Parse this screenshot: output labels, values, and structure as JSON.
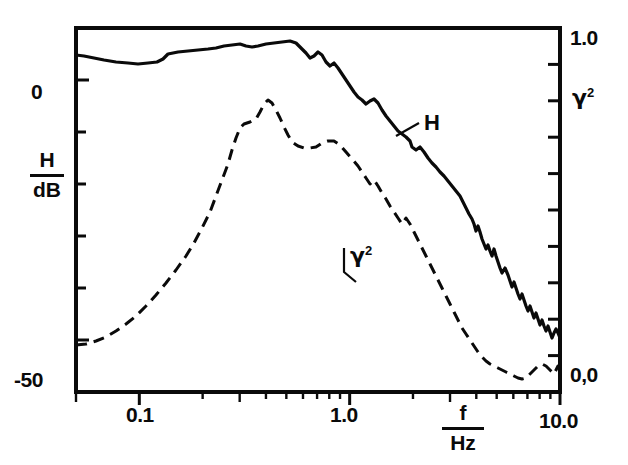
{
  "figure": {
    "background_color": "#ffffff",
    "ink_color": "#0a0a0a",
    "frame": {
      "left": 76,
      "right": 560,
      "top": 28,
      "bottom": 392
    }
  },
  "axes": {
    "left": {
      "label_numerator": "H",
      "label_denominator": "dB",
      "tick_labels": [
        "0",
        "-50"
      ],
      "tick_label_top": "0",
      "tick_label_bottom": "-50",
      "range_db": [
        -60,
        10
      ],
      "tick_step_db": 10
    },
    "right": {
      "label": "γ²",
      "label_base": "γ",
      "label_exponent": "2",
      "tick_label_top": "1.0",
      "tick_label_bottom": "0,0",
      "range": [
        0.0,
        1.0
      ]
    },
    "bottom": {
      "label_numerator": "f",
      "label_denominator": "Hz",
      "tick_labels": [
        "0.1",
        "1.0",
        "10.0"
      ],
      "scale": "log",
      "range_hz": [
        0.05,
        10.0
      ]
    }
  },
  "curve_labels": {
    "transfer_function": "H",
    "coherence_base": "γ",
    "coherence_exponent": "2"
  },
  "chart_data": {
    "type": "line",
    "title": "",
    "xlabel": "f / Hz",
    "ylabel": "H / dB",
    "y2label": "γ²",
    "xscale": "log",
    "xlim": [
      0.05,
      10.0
    ],
    "ylim": [
      -60,
      10
    ],
    "y2lim": [
      0.0,
      1.0
    ],
    "grid": false,
    "legend": "inline-annotations",
    "xticks": [
      0.1,
      1.0,
      10.0
    ],
    "xticklabels": [
      "0.1",
      "1.0",
      "10.0"
    ],
    "yticks": [
      0,
      -50
    ],
    "yticklabels": [
      "0",
      "-50"
    ],
    "y2ticks": [
      0.0,
      1.0
    ],
    "y2ticklabels": [
      "0,0",
      "1.0"
    ],
    "series": [
      {
        "name": "H",
        "axis": "left",
        "style": "solid",
        "linewidth": 3.2,
        "annotation": "H",
        "points_px": [
          [
            76,
            55
          ],
          [
            84,
            56
          ],
          [
            94,
            58
          ],
          [
            104,
            60
          ],
          [
            116,
            62
          ],
          [
            128,
            63
          ],
          [
            138,
            64
          ],
          [
            148,
            63
          ],
          [
            157,
            62
          ],
          [
            163,
            59
          ],
          [
            168,
            54
          ],
          [
            178,
            52
          ],
          [
            188,
            51
          ],
          [
            198,
            50
          ],
          [
            208,
            49
          ],
          [
            216,
            48
          ],
          [
            224,
            46
          ],
          [
            232,
            45
          ],
          [
            240,
            44
          ],
          [
            246,
            46
          ],
          [
            252,
            47
          ],
          [
            258,
            46
          ],
          [
            266,
            44
          ],
          [
            274,
            43
          ],
          [
            282,
            42
          ],
          [
            290,
            41
          ],
          [
            296,
            43
          ],
          [
            300,
            47
          ],
          [
            306,
            53
          ],
          [
            310,
            58
          ],
          [
            314,
            56
          ],
          [
            318,
            52
          ],
          [
            322,
            55
          ],
          [
            326,
            62
          ],
          [
            330,
            66
          ],
          [
            334,
            63
          ],
          [
            338,
            68
          ],
          [
            342,
            74
          ],
          [
            346,
            80
          ],
          [
            350,
            86
          ],
          [
            354,
            92
          ],
          [
            358,
            97
          ],
          [
            362,
            100
          ],
          [
            366,
            104
          ],
          [
            370,
            101
          ],
          [
            374,
            99
          ],
          [
            378,
            103
          ],
          [
            382,
            110
          ],
          [
            386,
            116
          ],
          [
            390,
            121
          ],
          [
            394,
            126
          ],
          [
            398,
            131
          ],
          [
            402,
            134
          ],
          [
            406,
            137
          ],
          [
            410,
            141
          ],
          [
            412,
            147
          ],
          [
            416,
            150
          ],
          [
            420,
            147
          ],
          [
            424,
            152
          ],
          [
            428,
            158
          ],
          [
            432,
            163
          ],
          [
            436,
            167
          ],
          [
            440,
            172
          ],
          [
            444,
            176
          ],
          [
            448,
            181
          ],
          [
            452,
            186
          ],
          [
            456,
            191
          ],
          [
            460,
            196
          ],
          [
            463,
            202
          ],
          [
            466,
            208
          ],
          [
            469,
            214
          ],
          [
            472,
            219
          ],
          [
            474,
            224
          ],
          [
            476,
            231
          ],
          [
            478,
            226
          ],
          [
            480,
            232
          ],
          [
            482,
            239
          ],
          [
            484,
            244
          ],
          [
            486,
            249
          ],
          [
            488,
            245
          ],
          [
            490,
            251
          ],
          [
            492,
            256
          ],
          [
            494,
            249
          ],
          [
            496,
            256
          ],
          [
            498,
            262
          ],
          [
            500,
            268
          ],
          [
            502,
            273
          ],
          [
            505,
            268
          ],
          [
            508,
            275
          ],
          [
            510,
            281
          ],
          [
            512,
            287
          ],
          [
            514,
            282
          ],
          [
            516,
            288
          ],
          [
            518,
            294
          ],
          [
            520,
            299
          ],
          [
            522,
            294
          ],
          [
            524,
            300
          ],
          [
            526,
            306
          ],
          [
            528,
            311
          ],
          [
            530,
            306
          ],
          [
            532,
            312
          ],
          [
            534,
            318
          ],
          [
            536,
            313
          ],
          [
            538,
            319
          ],
          [
            540,
            325
          ],
          [
            542,
            320
          ],
          [
            544,
            326
          ],
          [
            546,
            331
          ],
          [
            548,
            326
          ],
          [
            550,
            332
          ],
          [
            552,
            338
          ],
          [
            554,
            333
          ],
          [
            556,
            329
          ],
          [
            558,
            333
          ],
          [
            560,
            338
          ]
        ]
      },
      {
        "name": "gamma2",
        "axis": "right",
        "style": "dashed",
        "linewidth": 3.0,
        "dash_pattern": "11 7",
        "annotation": "γ²",
        "points_px": [
          [
            76,
            345
          ],
          [
            86,
            344
          ],
          [
            96,
            341
          ],
          [
            106,
            337
          ],
          [
            116,
            331
          ],
          [
            126,
            324
          ],
          [
            136,
            316
          ],
          [
            146,
            306
          ],
          [
            156,
            295
          ],
          [
            166,
            283
          ],
          [
            176,
            270
          ],
          [
            186,
            256
          ],
          [
            194,
            243
          ],
          [
            202,
            228
          ],
          [
            210,
            212
          ],
          [
            216,
            196
          ],
          [
            222,
            180
          ],
          [
            228,
            164
          ],
          [
            232,
            150
          ],
          [
            236,
            138
          ],
          [
            240,
            128
          ],
          [
            244,
            124
          ],
          [
            250,
            122
          ],
          [
            256,
            119
          ],
          [
            260,
            112
          ],
          [
            264,
            104
          ],
          [
            268,
            100
          ],
          [
            272,
            103
          ],
          [
            276,
            110
          ],
          [
            280,
            118
          ],
          [
            284,
            127
          ],
          [
            288,
            135
          ],
          [
            292,
            142
          ],
          [
            298,
            146
          ],
          [
            304,
            148
          ],
          [
            310,
            148
          ],
          [
            316,
            147
          ],
          [
            322,
            143
          ],
          [
            328,
            141
          ],
          [
            334,
            141
          ],
          [
            340,
            145
          ],
          [
            346,
            152
          ],
          [
            352,
            159
          ],
          [
            358,
            166
          ],
          [
            362,
            172
          ],
          [
            366,
            178
          ],
          [
            370,
            184
          ],
          [
            374,
            180
          ],
          [
            378,
            186
          ],
          [
            382,
            193
          ],
          [
            386,
            199
          ],
          [
            390,
            206
          ],
          [
            394,
            212
          ],
          [
            398,
            218
          ],
          [
            402,
            224
          ],
          [
            406,
            218
          ],
          [
            410,
            224
          ],
          [
            414,
            232
          ],
          [
            418,
            240
          ],
          [
            422,
            248
          ],
          [
            426,
            256
          ],
          [
            430,
            264
          ],
          [
            434,
            272
          ],
          [
            438,
            280
          ],
          [
            442,
            288
          ],
          [
            446,
            296
          ],
          [
            450,
            304
          ],
          [
            454,
            312
          ],
          [
            458,
            320
          ],
          [
            462,
            328
          ],
          [
            466,
            334
          ],
          [
            470,
            340
          ],
          [
            474,
            346
          ],
          [
            478,
            352
          ],
          [
            482,
            357
          ],
          [
            486,
            361
          ],
          [
            490,
            364
          ],
          [
            494,
            366
          ],
          [
            498,
            368
          ],
          [
            502,
            370
          ],
          [
            506,
            372
          ],
          [
            510,
            374
          ],
          [
            514,
            376
          ],
          [
            518,
            378
          ],
          [
            522,
            379
          ],
          [
            526,
            378
          ],
          [
            530,
            374
          ],
          [
            534,
            370
          ],
          [
            538,
            366
          ],
          [
            542,
            364
          ],
          [
            546,
            366
          ],
          [
            550,
            370
          ],
          [
            554,
            374
          ],
          [
            556,
            370
          ],
          [
            558,
            366
          ],
          [
            560,
            370
          ]
        ]
      }
    ]
  }
}
